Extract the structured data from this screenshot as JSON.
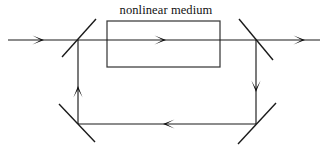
{
  "figure": {
    "title": "nonlinear medium",
    "caption_x": 166,
    "caption_y": 14,
    "width": 327,
    "height": 150,
    "background_color": "#ffffff",
    "line_color": "#1a1a1a",
    "box_color": "#3a3a3a",
    "arrow_color": "#0d0d0d"
  },
  "medium_box": {
    "label": "nonlinear medium",
    "x": 107,
    "y": 21,
    "width": 113,
    "height": 46
  },
  "beams": {
    "input": {
      "label": "input beam",
      "x1": 8,
      "y1": 40,
      "x2": 78,
      "y2": 40,
      "direction": "right"
    },
    "upper_arm": {
      "label": "upper arm beam",
      "x1": 78,
      "y1": 40,
      "x2": 256,
      "y2": 40,
      "direction": "right"
    },
    "output": {
      "label": "output beam",
      "x1": 256,
      "y1": 40,
      "x2": 320,
      "y2": 40,
      "direction": "right"
    },
    "left_vertical": {
      "label": "left vertical arm",
      "x1": 78,
      "y1": 124,
      "x2": 78,
      "y2": 40,
      "direction": "up"
    },
    "right_vertical": {
      "label": "right vertical arm",
      "x1": 256,
      "y1": 40,
      "x2": 256,
      "y2": 124,
      "direction": "down"
    },
    "lower_arm": {
      "label": "lower arm beam",
      "x1": 256,
      "y1": 124,
      "x2": 78,
      "y2": 124,
      "direction": "left"
    }
  },
  "arrows": [
    {
      "name": "input-beam-arrow",
      "x": 44,
      "y": 40,
      "dir": "right"
    },
    {
      "name": "medium-beam-arrow",
      "x": 166,
      "y": 40,
      "dir": "right"
    },
    {
      "name": "output-beam-arrow",
      "x": 305,
      "y": 40,
      "dir": "right"
    },
    {
      "name": "left-arm-arrow",
      "x": 78,
      "y": 86,
      "dir": "up"
    },
    {
      "name": "right-arm-arrow",
      "x": 256,
      "y": 92,
      "dir": "down"
    },
    {
      "name": "lower-arm-arrow",
      "x": 163,
      "y": 124,
      "dir": "left"
    }
  ],
  "optics": [
    {
      "name": "beam-splitter-top-left",
      "type": "beam-splitter",
      "x1": 62,
      "y1": 57,
      "x2": 96,
      "y2": 19
    },
    {
      "name": "beam-splitter-top-right",
      "type": "beam-splitter",
      "x1": 239,
      "y1": 19,
      "x2": 273,
      "y2": 60
    },
    {
      "name": "mirror-bottom-left",
      "type": "mirror",
      "x1": 59,
      "y1": 104,
      "x2": 95,
      "y2": 142
    },
    {
      "name": "mirror-bottom-right",
      "type": "mirror",
      "x1": 238,
      "y1": 144,
      "x2": 276,
      "y2": 103
    }
  ]
}
